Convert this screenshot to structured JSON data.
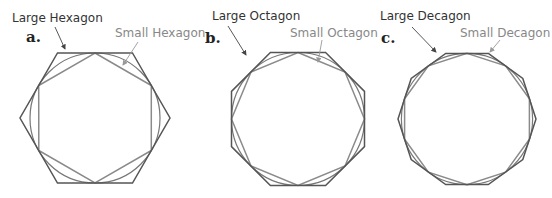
{
  "panels": [
    {
      "letter": "a.",
      "large_label": "Large Hexagon",
      "small_label": "Small Hexagon",
      "sides": 6,
      "center": [
        95,
        118
      ],
      "radius": 75
    },
    {
      "letter": "b.",
      "large_label": "Large Octagon",
      "small_label": "Small Octagon",
      "sides": 8,
      "center": [
        298,
        119
      ],
      "radius": 72
    },
    {
      "letter": "c.",
      "large_label": "Large Decagon",
      "small_label": "Small Decagon",
      "sides": 10,
      "center": [
        467,
        119
      ],
      "radius": 69
    }
  ],
  "colors": {
    "large_polygon": "#555555",
    "small_polygon": "#8a8a8a",
    "circle": "#777777",
    "large_label": "#333333",
    "small_label": "#888888"
  }
}
